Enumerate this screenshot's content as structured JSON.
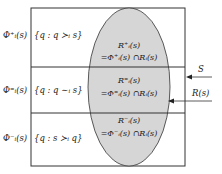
{
  "rows": [
    {
      "phi": "Φ⁺ᵢ(s)",
      "set": "{q : q ≻ᵢ s}",
      "r_label": "R⁺ᵢ(s)",
      "eq": "=Φ⁺ᵢ(s) ∩Rᵢ(s)"
    },
    {
      "phi": "Φ⁼ᵢ(s)",
      "set": "{q : q ∼ᵢ s}",
      "r_label": "R⁼ᵢ(s)",
      "eq": "=Φ⁼ᵢ(s) ∩Rᵢ(s)"
    },
    {
      "phi": "Φ⁻ᵢ(s)",
      "set": "{q : s ≻ᵢ q}",
      "r_label": "R⁻ᵢ(s)",
      "eq": "=Φ⁻ᵢ(s) ∩Rᵢ(s)"
    }
  ],
  "arrows": {
    "s_label": "S",
    "r_label": "R(s)"
  },
  "colors": {
    "ellipse_fill": "#d6d6d6",
    "line": "#333333"
  }
}
